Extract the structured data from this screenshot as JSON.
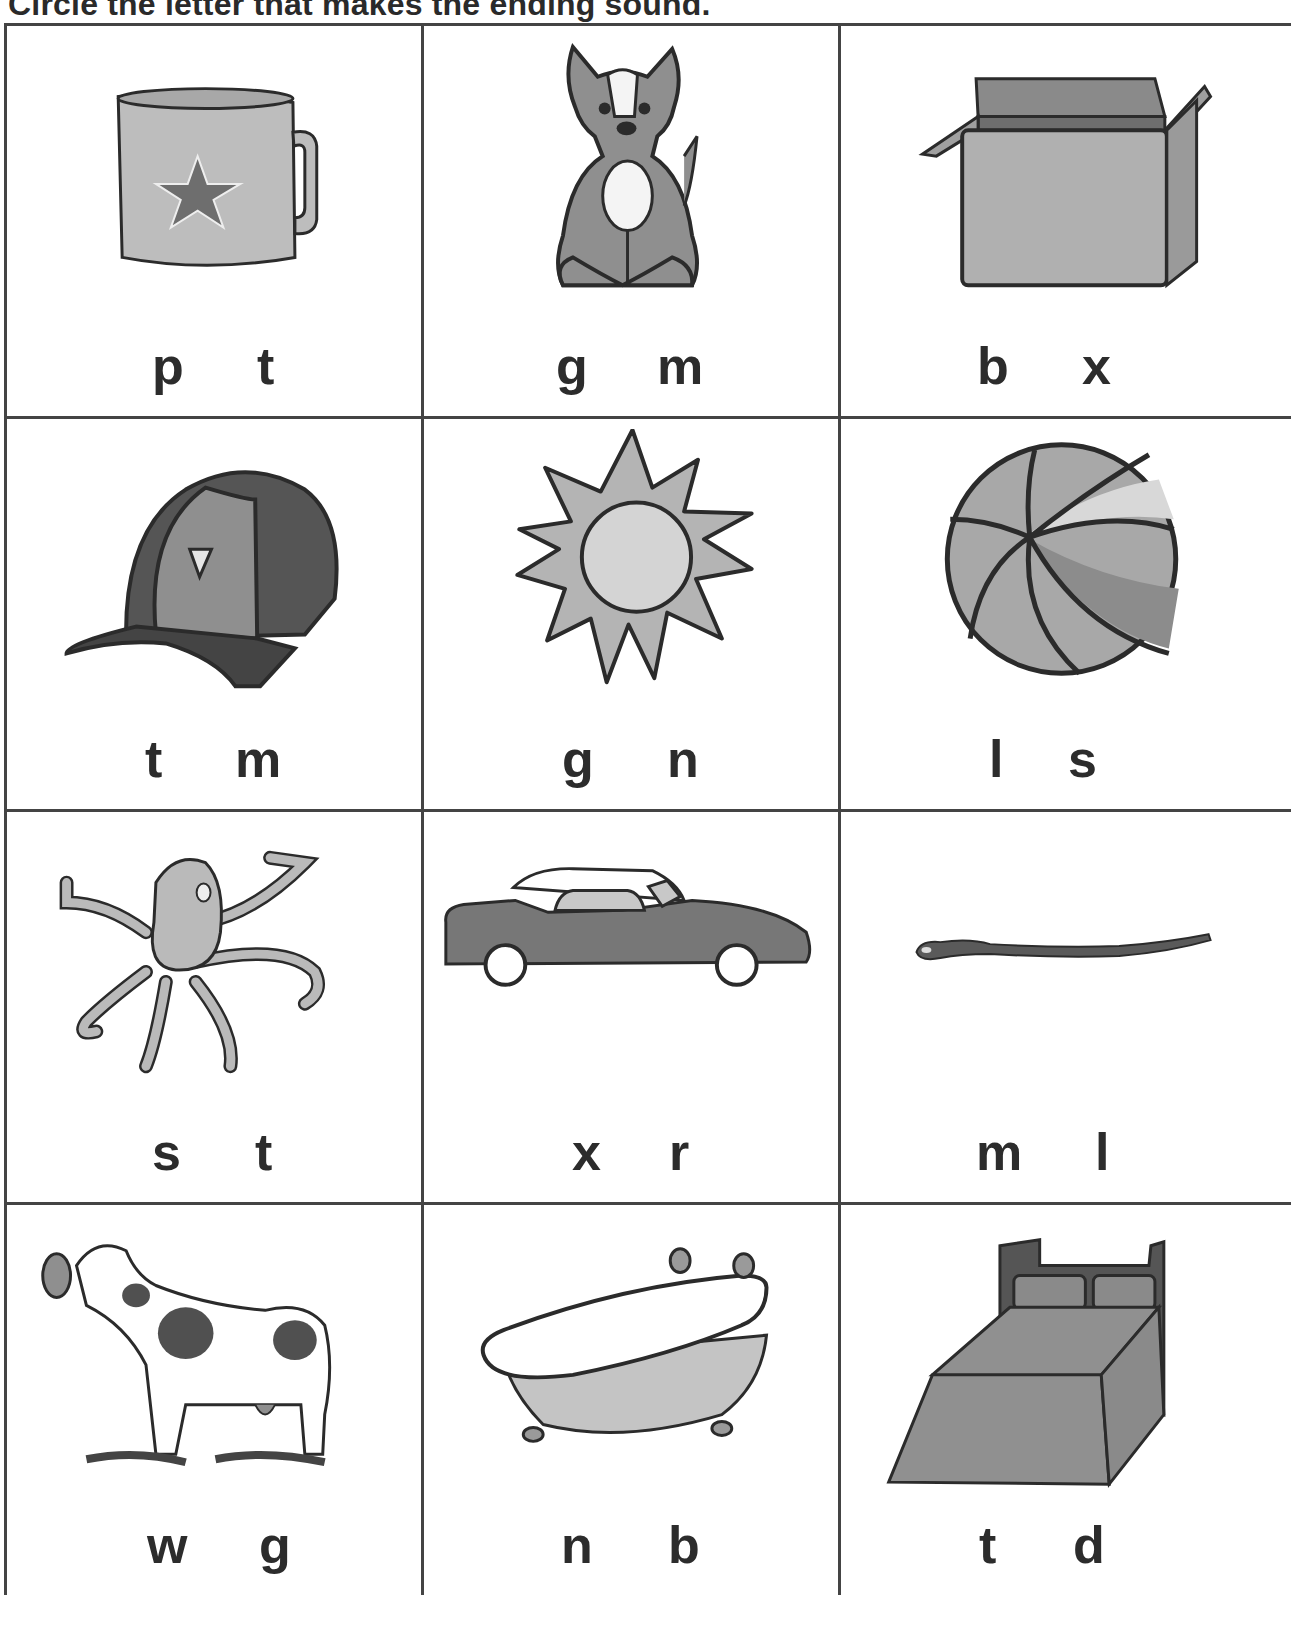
{
  "title": "Circle the letter that makes the ending sound.",
  "colors": {
    "line": "#2b2b2b",
    "fill_light": "#bdbdbd",
    "fill_mid": "#9a9a9a",
    "fill_dark": "#6e6e6e",
    "fill_darker": "#505050",
    "grid_border": "#444444"
  },
  "cells": [
    {
      "picture": "mug",
      "icon": "mug-icon",
      "letters": [
        "p",
        "t"
      ]
    },
    {
      "picture": "dog",
      "icon": "dog-icon",
      "letters": [
        "g",
        "m"
      ]
    },
    {
      "picture": "box",
      "icon": "box-icon",
      "letters": [
        "b",
        "x"
      ]
    },
    {
      "picture": "hat",
      "icon": "cap-icon",
      "letters": [
        "t",
        "m"
      ]
    },
    {
      "picture": "sun",
      "icon": "sun-icon",
      "letters": [
        "g",
        "n"
      ]
    },
    {
      "picture": "ball",
      "icon": "ball-icon",
      "letters": [
        "l",
        "s"
      ]
    },
    {
      "picture": "octopus",
      "icon": "octopus-icon",
      "letters": [
        "s",
        "t"
      ]
    },
    {
      "picture": "car",
      "icon": "car-icon",
      "letters": [
        "x",
        "r"
      ]
    },
    {
      "picture": "worm",
      "icon": "worm-icon",
      "letters": [
        "m",
        "l"
      ]
    },
    {
      "picture": "cow",
      "icon": "cow-icon",
      "letters": [
        "w",
        "g"
      ]
    },
    {
      "picture": "tub",
      "icon": "bathtub-icon",
      "letters": [
        "n",
        "b"
      ]
    },
    {
      "picture": "bed",
      "icon": "bed-icon",
      "letters": [
        "t",
        "d"
      ]
    }
  ]
}
